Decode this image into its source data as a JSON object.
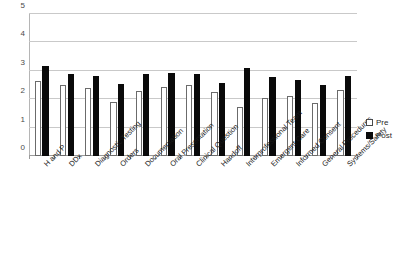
{
  "chart_data": {
    "type": "bar",
    "title": "",
    "subtitle": "",
    "xlabel": "",
    "ylabel": "",
    "ylim": [
      0,
      5
    ],
    "y_ticks": [
      0,
      1,
      2,
      3,
      4,
      5
    ],
    "grid": true,
    "legend_position": "right",
    "categories": [
      "H and P",
      "DDx",
      "Diagnostic Testing",
      "Orders",
      "Documentation",
      "Oral Presentation",
      "Clinical Question",
      "Handoff",
      "Interprofessional Team",
      "Emergent Care",
      "Informed Consent",
      "General Procedures",
      "Systems/Safety"
    ],
    "series": [
      {
        "name": "Pre",
        "color": "#ffffff",
        "values": [
          2.65,
          2.5,
          2.38,
          1.9,
          2.3,
          2.43,
          2.5,
          2.25,
          1.72,
          2.05,
          2.13,
          1.88,
          2.33
        ]
      },
      {
        "name": "Post",
        "color": "#0a0a0a",
        "values": [
          3.17,
          2.88,
          2.82,
          2.55,
          2.9,
          2.92,
          2.88,
          2.58,
          3.1,
          2.78,
          2.68,
          2.5,
          2.8
        ]
      }
    ]
  },
  "legend": {
    "items": [
      {
        "label": "Pre",
        "swatch": "hollow-square-icon"
      },
      {
        "label": "Post",
        "swatch": "filled-square-icon"
      }
    ]
  }
}
